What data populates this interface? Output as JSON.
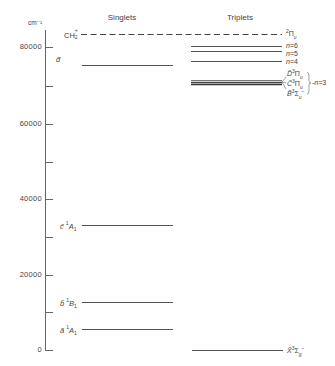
{
  "axis": {
    "unit": "cm⁻¹",
    "ticks": [
      {
        "value": 80000,
        "label": "80000",
        "y": 47
      },
      {
        "value": 70000,
        "label": "",
        "y": 86
      },
      {
        "value": 60000,
        "label": "60000",
        "y": 124
      },
      {
        "value": 50000,
        "label": "",
        "y": 162
      },
      {
        "value": 40000,
        "label": "40000",
        "y": 199
      },
      {
        "value": 30000,
        "label": "",
        "y": 237
      },
      {
        "value": 20000,
        "label": "20000",
        "y": 275
      },
      {
        "value": 10000,
        "label": "",
        "y": 312
      },
      {
        "value": 0,
        "label": "0",
        "y": 350
      }
    ]
  },
  "columns": {
    "singlets": "Singlets",
    "triplets": "Triplets"
  },
  "ion_limit": {
    "label": "CH₂⁺",
    "right_label": "²Πu",
    "energy_cm": 83800
  },
  "singlets": [
    {
      "letter": "d̃",
      "term": "",
      "energy_cm": 75700
    },
    {
      "letter": "c̃",
      "term": "¹A₁",
      "energy_cm": 33200
    },
    {
      "letter": "b̃",
      "term": "¹B₁",
      "energy_cm": 12800
    },
    {
      "letter": "ã",
      "term": "¹A₁",
      "energy_cm": 5800
    }
  ],
  "triplets": [
    {
      "label": "n=6",
      "energy_cm": 80200
    },
    {
      "label": "n=5",
      "energy_cm": 78900
    },
    {
      "label": "n=4",
      "energy_cm": 76200
    },
    {
      "label": "D̃³Πu",
      "energy_cm": 71200,
      "group": "n=3"
    },
    {
      "label": "C̃³Πu",
      "energy_cm": 70600,
      "group": "n=3"
    },
    {
      "label": "B̃³Σu⁻",
      "energy_cm": 70200,
      "group": "n=3"
    },
    {
      "label": "X̃³Σg⁻",
      "energy_cm": 0
    }
  ],
  "labels": {
    "n6": "n=6",
    "n5": "n=5",
    "n4": "n=4",
    "n3": "n=3",
    "D": "D̃",
    "C": "C̃",
    "B": "B̃",
    "X": "X̃",
    "d": "d̃",
    "c": "c̃",
    "b": "b̃",
    "a": "ã",
    "ion": "CH",
    "ion_sup": "+",
    "ion_sub": "2",
    "pi_u": "Π",
    "sigma": "Σ"
  },
  "colors": {
    "line": "#555555",
    "text": "#444444"
  }
}
